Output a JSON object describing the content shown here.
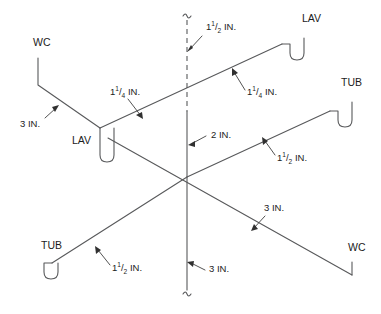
{
  "diagram": {
    "type": "plumbing-isometric-riser-diagram",
    "colors": {
      "pipe": "#58595b",
      "leader": "#404040",
      "text": "#1c1c1c",
      "background": "#ffffff"
    },
    "fixtures": [
      {
        "id": "wc-upper-left",
        "label": "WC",
        "x": 33,
        "y": 46
      },
      {
        "id": "lav-upper-right",
        "label": "LAV",
        "x": 302,
        "y": 22
      },
      {
        "id": "tub-right",
        "label": "TUB",
        "x": 341,
        "y": 86
      },
      {
        "id": "lav-left",
        "label": "LAV",
        "x": 72,
        "y": 144
      },
      {
        "id": "tub-lower-left",
        "label": "TUB",
        "x": 41,
        "y": 249
      },
      {
        "id": "wc-lower-right",
        "label": "WC",
        "x": 348,
        "y": 251
      }
    ],
    "size_labels": [
      {
        "id": "vent-stack-size",
        "value": "1",
        "fraction_num": "1",
        "fraction_den": "2",
        "unit": "IN.",
        "x": 206,
        "y": 30,
        "has_fraction": true
      },
      {
        "id": "lav-branch-right",
        "value": "1",
        "fraction_num": "1",
        "fraction_den": "4",
        "unit": "IN.",
        "x": 247,
        "y": 95,
        "has_fraction": true
      },
      {
        "id": "lav-branch-left",
        "value": "1",
        "fraction_num": "1",
        "fraction_den": "4",
        "unit": "IN.",
        "x": 110,
        "y": 95,
        "has_fraction": true
      },
      {
        "id": "wc-branch-upper",
        "value": "3",
        "fraction_num": "",
        "fraction_den": "",
        "unit": "IN.",
        "x": 20,
        "y": 127,
        "has_fraction": false
      },
      {
        "id": "vent-middle-size",
        "value": "2",
        "fraction_num": "",
        "fraction_den": "",
        "unit": "IN.",
        "x": 211,
        "y": 138,
        "has_fraction": false
      },
      {
        "id": "tub-branch-right",
        "value": "1",
        "fraction_num": "1",
        "fraction_den": "2",
        "unit": "IN.",
        "x": 277,
        "y": 161,
        "has_fraction": true
      },
      {
        "id": "wc-branch-lower",
        "value": "3",
        "fraction_num": "",
        "fraction_den": "",
        "unit": "IN.",
        "x": 264,
        "y": 211,
        "has_fraction": false
      },
      {
        "id": "tub-branch-left",
        "value": "1",
        "fraction_num": "1",
        "fraction_den": "2",
        "unit": "IN.",
        "x": 112,
        "y": 271,
        "has_fraction": true
      },
      {
        "id": "soil-stack-size",
        "value": "3",
        "fraction_num": "",
        "fraction_den": "",
        "unit": "IN.",
        "x": 209,
        "y": 272,
        "has_fraction": false
      }
    ],
    "pipe_runs": [
      {
        "id": "vent-stack-dashed",
        "description": "1-1/2 IN. vent stack above roof",
        "style": "dashed"
      },
      {
        "id": "soil-stack-vertical",
        "description": "2 IN. and 3 IN. vertical soil stack",
        "style": "solid"
      },
      {
        "id": "lav-run-upper",
        "description": "1-1/4 IN. lavatory branch running upper-left to upper-right",
        "style": "solid"
      },
      {
        "id": "tub-wc-run-lower",
        "description": "1-1/2 IN. and 3 IN. tub / water-closet branch crossing diagonal",
        "style": "solid"
      },
      {
        "id": "wc-drop-upper-left",
        "description": "3 IN. water closet drop, upper left",
        "style": "solid"
      },
      {
        "id": "wc-drop-lower-right",
        "description": "3 IN. water closet drop, lower right",
        "style": "solid"
      }
    ]
  }
}
